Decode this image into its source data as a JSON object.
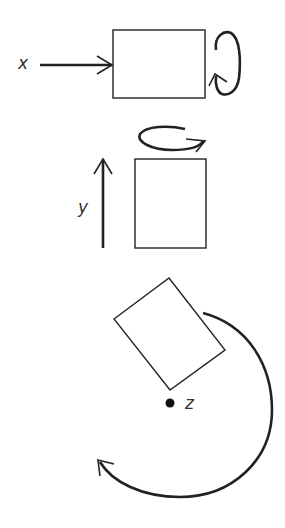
{
  "diagram": {
    "title": "",
    "panels": [
      {
        "axis_label": "x",
        "motion": "translation along x, rotation about x"
      },
      {
        "axis_label": "y",
        "motion": "translation along y, rotation about y"
      },
      {
        "axis_label": "z",
        "motion": "rotation about z"
      }
    ],
    "colors": {
      "stroke": "#222222",
      "background": "#ffffff",
      "label": "#333333"
    }
  }
}
